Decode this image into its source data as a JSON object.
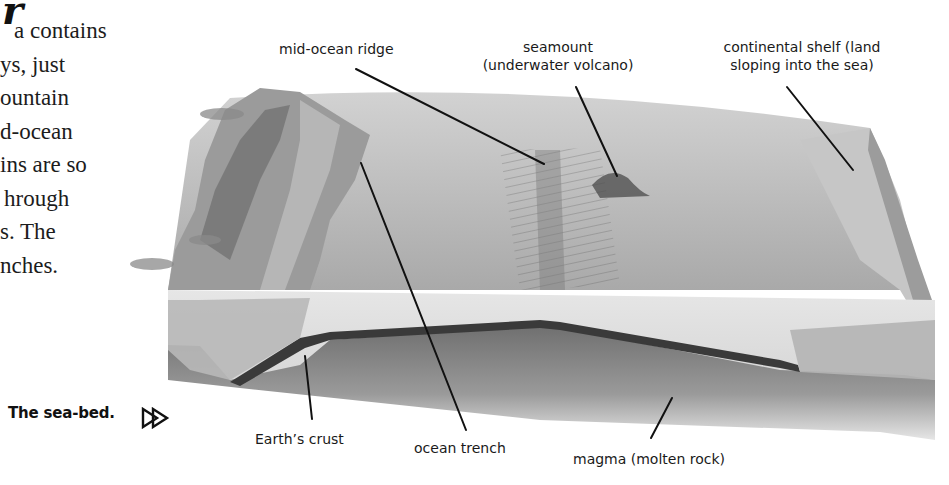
{
  "page": {
    "heading_fragment": "r",
    "body_lines": [
      "a contains",
      "ys, just",
      "ountain",
      "d-ocean",
      "ins are so",
      "hrough",
      "s. The",
      "nches."
    ],
    "caption": "The sea-bed.",
    "next_icon": "double-play-arrow-icon"
  },
  "diagram": {
    "labels": {
      "mid_ocean_ridge": "mid-ocean ridge",
      "seamount_line1": "seamount",
      "seamount_line2": "(underwater volcano)",
      "shelf_line1": "continental shelf (land",
      "shelf_line2": "sloping into the sea)",
      "earths_crust": "Earth’s crust",
      "ocean_trench": "ocean trench",
      "magma": "magma (molten rock)"
    },
    "colors": {
      "leader_line": "#111111",
      "crust_band": "#3a3a3a",
      "seafloor": "#a8a8a8",
      "magma": "#7a7a7a",
      "water_top": "#c9c9c9"
    }
  }
}
